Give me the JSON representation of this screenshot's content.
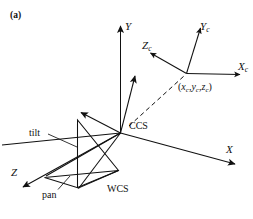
{
  "figure": {
    "panel_label": "(a)",
    "background_color": "#ffffff",
    "stroke_color": "#111111",
    "width": 253,
    "height": 219
  },
  "world_frame": {
    "name": "WCS",
    "name_label": "WCS",
    "origin_label": "CCS",
    "axes": [
      {
        "key": "x",
        "label": "X",
        "subscript": ""
      },
      {
        "key": "y",
        "label": "Y",
        "subscript": ""
      },
      {
        "key": "z",
        "label": "Z",
        "subscript": ""
      }
    ]
  },
  "camera_frame": {
    "axes": [
      {
        "key": "xc",
        "label": "X",
        "subscript": "c"
      },
      {
        "key": "yc",
        "label": "Y",
        "subscript": "c"
      },
      {
        "key": "zc",
        "label": "Z",
        "subscript": "c"
      }
    ],
    "origin_coordinate": {
      "open": "(",
      "x": "x",
      "x_sub": "c",
      "sep1": ",",
      "y": "y",
      "y_sub": "c",
      "sep2": ",",
      "z": "z",
      "z_sub": "c",
      "close": ")"
    }
  },
  "mechanism": {
    "tilt_label": "tilt",
    "pan_label": "pan"
  }
}
